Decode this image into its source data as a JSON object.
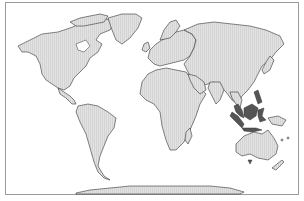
{
  "map": {
    "type": "world-map",
    "projection": "robinson-like",
    "colors": {
      "land": "#dcdcdc",
      "land_stroke": "#333333",
      "highlight": "#555555",
      "ocean": "#ffffff",
      "frame": "#9a9a9a"
    },
    "highlighted_regions": [
      "Indonesia",
      "Malaysia",
      "Philippines"
    ],
    "continents": [
      "North America",
      "Greenland",
      "South America",
      "Europe",
      "Africa",
      "Asia",
      "Australia",
      "Antarctica"
    ]
  }
}
